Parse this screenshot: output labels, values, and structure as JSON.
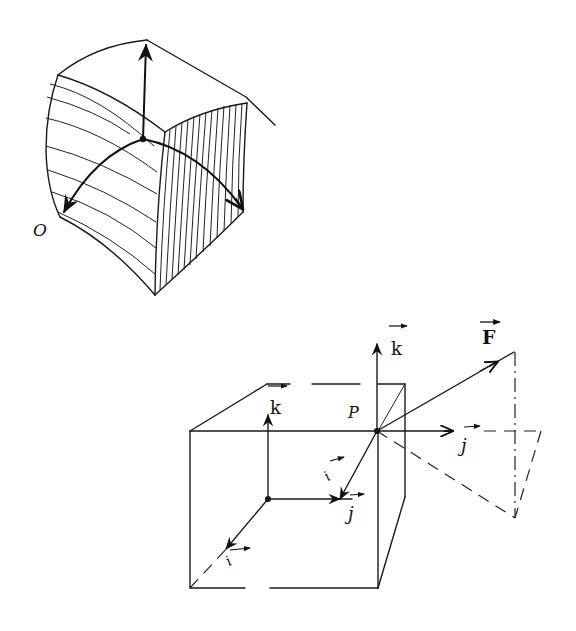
{
  "figures": [
    {
      "id": "curvilinear-coordinates",
      "description": "Curvilinear coordinate surface element with three tangent basis arrows at a point",
      "labels": {
        "origin": "O"
      }
    },
    {
      "id": "cartesian-force-decomposition",
      "description": "Cube with unit vectors i, j, k at a corner and force F decomposed at point P",
      "labels": {
        "k_top": "k",
        "k_cube": "k",
        "force": "F",
        "point": "P",
        "j_right": "j",
        "j_cube": "j",
        "i_at_p": "i",
        "i_cube": "i"
      }
    }
  ],
  "colors": {
    "ink": "#111111",
    "paper": "#ffffff"
  }
}
